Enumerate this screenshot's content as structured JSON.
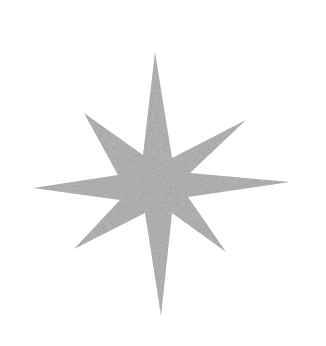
{
  "image": {
    "width": 326,
    "height": 346,
    "background": "#ffffff",
    "subject": "eight-pointed star",
    "star": {
      "fill": "#b9b9b9",
      "texture": "grainy glitter",
      "center": [
        157,
        185
      ],
      "outer_points": [
        [
          155,
          52
        ],
        [
          246,
          120
        ],
        [
          290,
          182
        ],
        [
          226,
          252
        ],
        [
          161,
          316
        ],
        [
          74,
          249
        ],
        [
          33,
          188
        ],
        [
          84,
          113
        ]
      ],
      "inner_points": [
        [
          172,
          158
        ],
        [
          190,
          173
        ],
        [
          188,
          197
        ],
        [
          172,
          213
        ],
        [
          145,
          213
        ],
        [
          120,
          200
        ],
        [
          118,
          175
        ],
        [
          143,
          155
        ]
      ]
    }
  }
}
